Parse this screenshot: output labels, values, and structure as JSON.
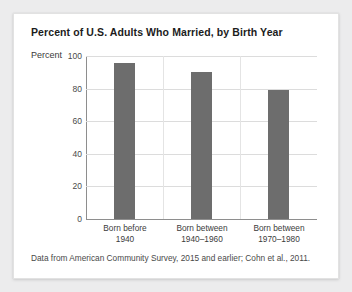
{
  "card": {
    "background_color": "#ffffff",
    "page_background_color": "#ececed"
  },
  "chart_data": {
    "type": "bar",
    "title": "Percent of U.S. Adults Who Married, by Birth Year",
    "categories": [
      "Born before 1940",
      "Born between 1940–1960",
      "Born between 1970–1980"
    ],
    "category_lines": [
      [
        "Born before",
        "1940"
      ],
      [
        "Born between",
        "1940–1960"
      ],
      [
        "Born between",
        "1970–1980"
      ]
    ],
    "values": [
      96,
      90,
      79
    ],
    "xlabel": "",
    "ylabel": "Percent",
    "ylim": [
      0,
      100
    ],
    "ytick_values": [
      0,
      20,
      40,
      60,
      80,
      100
    ],
    "ytick_labels": [
      "0",
      "20",
      "40",
      "60",
      "80",
      "100"
    ],
    "grid": true,
    "legend": false,
    "bar_color": "#6d6d6d",
    "gridline_color": "#dcdcdc",
    "axis_color": "#8e8e8e",
    "source_note": "Data from American Community Survey, 2015 and earlier; Cohn et al., 2011."
  }
}
